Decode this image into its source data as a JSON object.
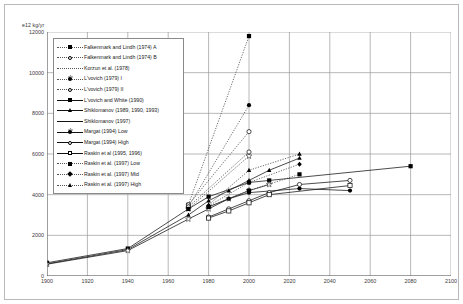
{
  "chart_data": {
    "type": "line",
    "title": "",
    "xlabel": "",
    "ylabel": "e12 kg/yr",
    "yunit_caption": "e12 kg/yr",
    "xlim": [
      1900,
      2100
    ],
    "ylim": [
      0,
      12000
    ],
    "xticks": [
      1900,
      1920,
      1940,
      1960,
      1980,
      2000,
      2020,
      2040,
      2060,
      2080,
      2100
    ],
    "yticks": [
      0,
      2000,
      4000,
      6000,
      8000,
      10000,
      12000
    ],
    "grid": true,
    "legend_position": "upper-left-inside",
    "series": [
      {
        "name": "Falkenmark and Lindh (1974) A",
        "marker": "square-filled",
        "line": "dotted",
        "x": [
          1970,
          2000
        ],
        "values": [
          3500,
          11800
        ]
      },
      {
        "name": "Falkenmark and Lindh (1974) B",
        "marker": "circle-open",
        "line": "dotted",
        "x": [
          1970,
          2000
        ],
        "values": [
          3500,
          7100
        ]
      },
      {
        "name": "Korzun et al. (1978)",
        "marker": "star-open",
        "line": "dotted",
        "x": [
          1970,
          2000
        ],
        "values": [
          3300,
          5900
        ]
      },
      {
        "name": "L'vovich (1979) I",
        "marker": "circle-filled",
        "line": "dotted",
        "x": [
          1970,
          2000
        ],
        "values": [
          3400,
          8400
        ]
      },
      {
        "name": "L'vovich (1979) II",
        "marker": "circle-open",
        "line": "dotted",
        "x": [
          1970,
          2000
        ],
        "values": [
          3400,
          6100
        ]
      },
      {
        "name": "L'vovich and White (1990)",
        "marker": "square-filled",
        "line": "solid",
        "x": [
          1900,
          1940,
          1970,
          1980,
          2000,
          2010,
          2080
        ],
        "values": [
          650,
          1350,
          3300,
          3900,
          4600,
          4700,
          5400
        ]
      },
      {
        "name": "Shiklomanov (1989, 1990, 1993)",
        "marker": "triangle-filled",
        "line": "solid",
        "x": [
          1900,
          1940,
          1970,
          1980,
          1990,
          2000,
          2010,
          2025
        ],
        "values": [
          600,
          1300,
          3000,
          3700,
          4200,
          4700,
          5200,
          5800
        ]
      },
      {
        "name": "Shiklomanov (1997)",
        "marker": "star-open",
        "line": "solid",
        "x": [
          1900,
          1940,
          1970,
          1980,
          1990,
          2000,
          2010
        ],
        "values": [
          580,
          1250,
          2800,
          3300,
          3800,
          4200,
          4500
        ]
      },
      {
        "name": "Margat (1994) Low",
        "marker": "circle-filled",
        "line": "solid",
        "x": [
          1980,
          1990,
          2000,
          2025,
          2050
        ],
        "values": [
          3400,
          3800,
          4100,
          4300,
          4200
        ]
      },
      {
        "name": "Margat (1994) High",
        "marker": "circle-open",
        "line": "solid",
        "x": [
          1980,
          1990,
          2000,
          2010,
          2025,
          2050
        ],
        "values": [
          2900,
          3300,
          3700,
          4100,
          4500,
          4700
        ]
      },
      {
        "name": "Raskin et al. (1995, 1996)",
        "marker": "square-open",
        "line": "solid",
        "x": [
          1980,
          1990,
          2000,
          2010,
          2050
        ],
        "values": [
          2850,
          3200,
          3600,
          4000,
          4450
        ]
      },
      {
        "name": "Raskin et al. (1997) Low",
        "marker": "square-filled",
        "line": "dotted",
        "x": [
          1980,
          2000,
          2025
        ],
        "values": [
          3400,
          4200,
          5000
        ]
      },
      {
        "name": "Raskin et al. (1997) Mid",
        "marker": "diamond-filled",
        "line": "dotted",
        "x": [
          1980,
          2000,
          2025
        ],
        "values": [
          3450,
          4600,
          5500
        ]
      },
      {
        "name": "Raskin et al. (1997) High",
        "marker": "triangle-filled",
        "line": "dotted",
        "x": [
          1980,
          2000,
          2025
        ],
        "values": [
          3500,
          5200,
          6000
        ]
      }
    ]
  },
  "axes": {
    "y_unit_caption": "e12 kg/yr",
    "y_labels": [
      "12000",
      "10000",
      "8000",
      "6000",
      "4000",
      "2000",
      "0"
    ],
    "x_labels": [
      "1900",
      "1920",
      "1940",
      "1960",
      "1980",
      "2000",
      "2020",
      "2040",
      "2060",
      "2080",
      "2100"
    ]
  },
  "legend": {
    "items": [
      {
        "label": "Falkenmark and Lindh (1974) A",
        "marker": "square-filled",
        "line": "dotted"
      },
      {
        "label": "Falkenmark and Lindh (1974) B",
        "marker": "circle-open",
        "line": "dotted"
      },
      {
        "label": "Korzun et al. (1978)",
        "marker": "star-open",
        "line": "dotted"
      },
      {
        "label": "L'vovich (1979) I",
        "marker": "circle-filled",
        "line": "dotted"
      },
      {
        "label": "L'vovich (1979) II",
        "marker": "circle-open",
        "line": "dotted"
      },
      {
        "label": "L'vovich and White (1990)",
        "marker": "square-filled",
        "line": "solid"
      },
      {
        "label": "Shiklomanov (1989, 1990, 1993)",
        "marker": "triangle-filled",
        "line": "solid"
      },
      {
        "label": "Shiklomanov (1997)",
        "marker": "star-open",
        "line": "solid"
      },
      {
        "label": "Margat (1994) Low",
        "marker": "circle-filled",
        "line": "solid"
      },
      {
        "label": "Margat (1994) High",
        "marker": "circle-open",
        "line": "solid"
      },
      {
        "label": "Raskin et al (1995, 1996)",
        "marker": "square-open",
        "line": "solid"
      },
      {
        "label": "Raskin et al. (1997) Low",
        "marker": "square-filled",
        "line": "dotted"
      },
      {
        "label": "Raskin et al. (1997) Mid",
        "marker": "diamond-filled",
        "line": "dotted"
      },
      {
        "label": "Raskin et al. (1997) High",
        "marker": "triangle-filled",
        "line": "dotted"
      }
    ]
  },
  "colors": {
    "grid": "#9a9a9a",
    "axis": "#555555",
    "line": "#111111",
    "frame": "#b9b9b9",
    "background": "#ffffff"
  }
}
